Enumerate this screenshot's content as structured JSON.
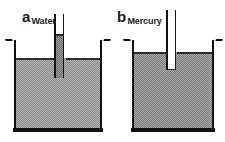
{
  "figure": {
    "type": "capillary-action-diagram",
    "width": 225,
    "height": 142,
    "background": "#ffffff",
    "ink_color": "#111111",
    "liquid_fill_color": "#b3b3b3",
    "liquid_dither_color": "#8c8c8c"
  },
  "panels": [
    {
      "id": "a",
      "letter": "a",
      "title": "Water",
      "liquid_name": "Water",
      "effect": "capillary-rise",
      "beaker": {
        "left": 14,
        "top": 40,
        "width": 88,
        "height": 92,
        "wall_thickness": 2,
        "floor_thickness": 4,
        "has_flared_lips": true
      },
      "liquid": {
        "surface_y": 58,
        "fill_color": "#b3b3b3"
      },
      "tube": {
        "center_x": 59,
        "outer_width": 11,
        "bore_width": 6,
        "top_y": 14,
        "bottom_y": 78,
        "column_top_y": 34,
        "column_bottom_y": 78,
        "meniscus_shape": "concave",
        "meniscus_y": 34,
        "note": "liquid column stands above the beaker surface"
      }
    },
    {
      "id": "b",
      "letter": "b",
      "title": "Mercury",
      "liquid_name": "Mercury",
      "effect": "capillary-depression",
      "beaker": {
        "left": 132,
        "top": 40,
        "width": 82,
        "height": 92,
        "wall_thickness": 2,
        "floor_thickness": 4,
        "has_flared_lips": true
      },
      "liquid": {
        "surface_y": 52,
        "fill_color": "#a8a8a8"
      },
      "tube": {
        "center_x": 171,
        "outer_width": 11,
        "bore_width": 6,
        "top_y": 10,
        "bottom_y": 70,
        "column_top_y": 70,
        "column_bottom_y": 70,
        "meniscus_shape": "convex",
        "meniscus_y": 70,
        "note": "liquid inside the tube is depressed below the beaker surface"
      }
    }
  ]
}
